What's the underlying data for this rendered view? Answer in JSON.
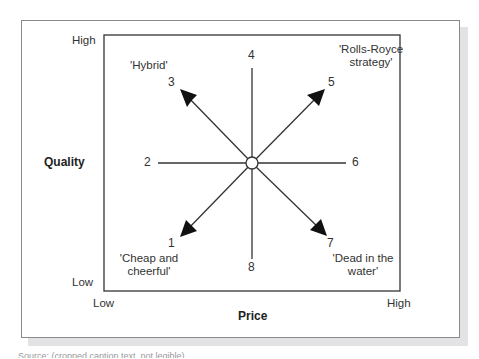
{
  "diagram": {
    "axes": {
      "y_label": "Quality",
      "y_high": "High",
      "y_low": "Low",
      "x_label": "Price",
      "x_low": "Low",
      "x_high": "High"
    },
    "positions": [
      {
        "id": "1",
        "name": "'Cheap and cheerful'",
        "name_line1": "'Cheap and",
        "name_line2": "cheerful'",
        "arrow": true
      },
      {
        "id": "2",
        "name": "",
        "arrow": false
      },
      {
        "id": "3",
        "name": "'Hybrid'",
        "arrow": true
      },
      {
        "id": "4",
        "name": "",
        "arrow": false
      },
      {
        "id": "5",
        "name": "'Rolls-Royce strategy'",
        "name_line1": "'Rolls-Royce",
        "name_line2": "strategy'",
        "arrow": true
      },
      {
        "id": "6",
        "name": "",
        "arrow": false
      },
      {
        "id": "7",
        "name": "'Dead in the water'",
        "name_line1": "'Dead in the",
        "name_line2": "water'",
        "arrow": true
      },
      {
        "id": "8",
        "name": "",
        "arrow": false
      }
    ],
    "caption": "Source: (cropped caption text, not legible)",
    "colors": {
      "line": "#333333",
      "frame": "#8a8a8a",
      "shadow": "#e3e3e6",
      "text": "#333333"
    }
  }
}
